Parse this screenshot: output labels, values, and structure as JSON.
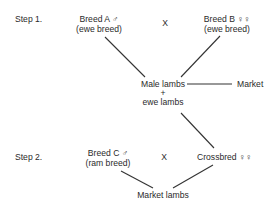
{
  "steps": [
    {
      "label": "Step 1."
    },
    {
      "label": "Step 2."
    }
  ],
  "step1": {
    "breed_a": {
      "name": "Breed  A ♂",
      "type": "(ewe breed)"
    },
    "cross_symbol": "X",
    "breed_b": {
      "name": "Breed  B ♀♀",
      "type": "(ewe breed)"
    },
    "offspring": {
      "line1": "Male lambs",
      "plus": "+",
      "line2": "ewe lambs"
    },
    "market": "Market"
  },
  "step2": {
    "breed_c": {
      "name": "Breed C ♂",
      "type": "(ram breed)"
    },
    "cross_symbol": "X",
    "crossbred": "Crossbred  ♀♀",
    "result": "Market lambs"
  }
}
